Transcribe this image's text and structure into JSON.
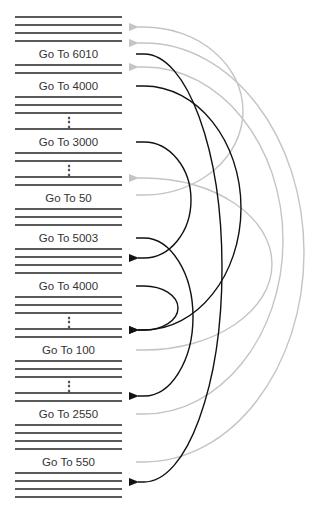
{
  "colors": {
    "code_line": "#222222",
    "forward_arrow": "#111111",
    "backward_arrow": "#c4c4c4",
    "text": "#333333"
  },
  "program": {
    "x_start": 15,
    "x_end": 122,
    "lines_y": [
      17,
      25,
      33,
      41,
      65,
      73,
      97,
      105,
      113,
      129,
      153,
      161,
      177,
      185,
      209,
      217,
      225,
      249,
      257,
      265,
      273,
      297,
      305,
      313,
      329,
      337,
      361,
      369,
      377,
      393,
      401,
      425,
      433,
      441,
      449,
      473,
      481,
      489,
      497
    ],
    "ellipsis": [
      {
        "y": 121,
        "text": "⋮"
      },
      {
        "y": 169,
        "text": "⋮"
      },
      {
        "y": 321,
        "text": "⋮"
      },
      {
        "y": 385,
        "text": "⋮"
      }
    ],
    "instructions": [
      {
        "label": "Go To 6010",
        "y": 54
      },
      {
        "label": "Go To 4000",
        "y": 86
      },
      {
        "label": "Go To 3000",
        "y": 142
      },
      {
        "label": "Go To 50",
        "y": 198
      },
      {
        "label": "Go To 5003",
        "y": 238
      },
      {
        "label": "Go To 4000",
        "y": 286
      },
      {
        "label": "Go To 100",
        "y": 350
      },
      {
        "label": "Go To 2550",
        "y": 414
      },
      {
        "label": "Go To 550",
        "y": 462
      }
    ]
  },
  "arrows": {
    "forward": [
      {
        "from": "Go To 6010",
        "from_y": 54,
        "to_y": 482,
        "reach_x": 222
      },
      {
        "from": "Go To 4000",
        "from_y": 86,
        "to_y": 330,
        "reach_x": 241
      },
      {
        "from": "Go To 3000",
        "from_y": 142,
        "to_y": 258,
        "reach_x": 191
      },
      {
        "from": "Go To 5003",
        "from_y": 238,
        "to_y": 396,
        "reach_x": 193
      },
      {
        "from": "Go To 4000",
        "from_y": 286,
        "to_y": 330,
        "reach_x": 178
      }
    ],
    "backward": [
      {
        "from": "Go To 50",
        "from_y": 195,
        "to_y": 27,
        "reach_x": 243
      },
      {
        "from": "Go To 100",
        "from_y": 350,
        "to_y": 178,
        "reach_x": 272
      },
      {
        "from": "Go To 2550",
        "from_y": 414,
        "to_y": 67,
        "reach_x": 283
      },
      {
        "from": "Go To 550",
        "from_y": 462,
        "to_y": 43,
        "reach_x": 304
      }
    ]
  }
}
